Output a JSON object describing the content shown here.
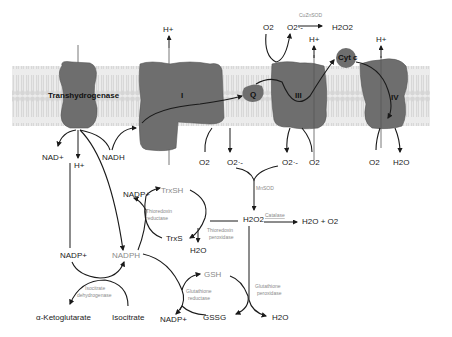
{
  "colors": {
    "membrane": "#dcdcdc",
    "membrane_stripe": "#c8c8c8",
    "protein": "#6e6e6e",
    "protein_edge": "#555555",
    "arrow": "#1a1a1a",
    "enzyme_text": "#8a8a8a"
  },
  "complexes": {
    "transhydrogenase": "Transhydrogenase",
    "complex1": "I",
    "ubiquinone": "Q",
    "complex3": "III",
    "cytc": "Cyt c",
    "complex4": "IV"
  },
  "membrane_top": {
    "h_plus_1": "H+",
    "h_plus_3": "H+",
    "h_plus_4": "H+",
    "o2_in": "O2",
    "o2_radical": "O2·-",
    "cuznsod": "CuZnSOD",
    "h2o2_top": "H2O2"
  },
  "matrix": {
    "nad_plus": "NAD+",
    "h_plus_th": "H+",
    "nadh": "NADH",
    "o2_c1": "O2",
    "o2_radical_c1": "O2·-",
    "o2_radical_c3": "O2·-",
    "o2_c3": "O2",
    "o2_c4": "O2",
    "h2o_c4": "H2O",
    "mnsod": "MnSOD",
    "h2o2": "H2O2",
    "catalase": "Catalase",
    "catalase_products": "H2O + O2",
    "nadp_plus_top": "NADP+",
    "trxsh": "TrxSH",
    "thioredoxin_reductase_1": "Thioredoxin",
    "thioredoxin_reductase_2": "reductase",
    "trxs": "TrxS",
    "thioredoxin_peroxidase_1": "Thioredoxin",
    "thioredoxin_peroxidase_2": "peroxidase",
    "h2o_trx": "H2O",
    "nadp_plus_left": "NADP+",
    "nadph": "NADPH",
    "isocitrate_dh_1": "Isocitrate",
    "isocitrate_dh_2": "dehydrogenase",
    "alpha_kg": "α-Ketoglutarate",
    "isocitrate": "Isocitrate",
    "gsh": "GSH",
    "glutathione_reductase_1": "Glutathione",
    "glutathione_reductase_2": "reductase",
    "nadp_plus_bottom": "NADP+",
    "gssg": "GSSG",
    "glutathione_peroxidase_1": "Glutathione",
    "glutathione_peroxidase_2": "peroxidase",
    "h2o_gpx": "H2O"
  }
}
